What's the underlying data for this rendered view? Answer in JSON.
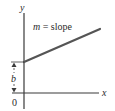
{
  "diagram": {
    "type": "slope-intercept-line",
    "axes": {
      "x_label": "x",
      "y_label": "y",
      "origin_label": "0"
    },
    "line": {
      "label_var": "m",
      "label_eq": " = slope"
    },
    "intercept": {
      "label": "b"
    },
    "colors": {
      "axis": "#3a3a3a",
      "line": "#555555",
      "text": "#2b2b2b"
    }
  }
}
